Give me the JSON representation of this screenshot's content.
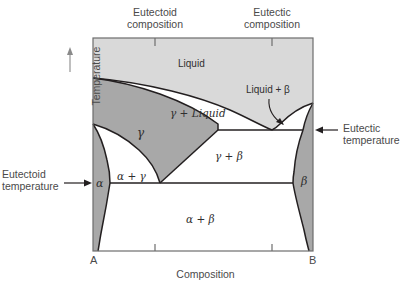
{
  "figure": {
    "kind": "binary-eutectic-eutectoid-phase-diagram",
    "axes": {
      "x_label": "Composition",
      "y_label": "Temperature",
      "left_endpoint": "A",
      "right_endpoint": "B"
    },
    "colors": {
      "liquid_fill": "#d9d9d9",
      "solid_solution_fill": "#a8a8a8",
      "two_phase_fill": "#ffffff",
      "line": "#231f20",
      "text": "#4a4a4a",
      "background": "#ffffff"
    },
    "region_labels": [
      {
        "id": "liquid",
        "text": "Liquid",
        "x": 196,
        "y": 64
      },
      {
        "id": "gamma-liquid",
        "text": "γ + Liquid",
        "x": 197,
        "y": 113
      },
      {
        "id": "liquid-beta",
        "text": "Liquid + β",
        "x": 274,
        "y": 90
      },
      {
        "id": "gamma",
        "text": "γ",
        "x": 141,
        "y": 132
      },
      {
        "id": "alpha",
        "text": "α",
        "x": 100,
        "y": 183
      },
      {
        "id": "beta",
        "text": "β",
        "x": 305,
        "y": 181
      },
      {
        "id": "alpha-gamma",
        "text": "α + γ",
        "x": 131,
        "y": 176
      },
      {
        "id": "gamma-beta",
        "text": "γ + β",
        "x": 229,
        "y": 156
      },
      {
        "id": "alpha-beta",
        "text": "α + β",
        "x": 200,
        "y": 219
      }
    ],
    "annotations": [
      {
        "id": "eutectoid-composition",
        "line1": "Eutectoid",
        "line2": "composition",
        "x": 155,
        "y": 8
      },
      {
        "id": "eutectic-composition",
        "line1": "Eutectic",
        "line2": "composition",
        "x": 272,
        "y": 8
      },
      {
        "id": "eutectic-temperature",
        "line1": "Eutectic",
        "line2": "temperature",
        "x": 343,
        "y": 121
      },
      {
        "id": "eutectoid-temperature",
        "line1": "Eutectoid",
        "line2": "temperature",
        "x": 12,
        "y": 166
      }
    ],
    "invariant_points": {
      "eutectic_composition_x": 272,
      "eutectic_temperature_y": 130,
      "eutectoid_composition_x": 160,
      "eutectoid_temperature_y": 183,
      "melting_point_A_y": 78,
      "melting_point_B_y": 103
    },
    "frame": {
      "left": 93,
      "top": 38,
      "right": 313,
      "bottom": 251
    },
    "tick_positions_x": [
      155,
      272
    ]
  }
}
